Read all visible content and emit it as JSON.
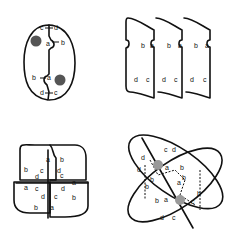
{
  "figure": {
    "panels": [
      {
        "id": "panel-1",
        "description": "Two cells forming a closed oval pair with nuclei",
        "labels": [
          "c",
          "d",
          "a",
          "b",
          "b",
          "a",
          "d",
          "c"
        ]
      },
      {
        "id": "panel-2",
        "description": "Three stacked tiles in a row",
        "labels": [
          "b",
          "a",
          "b",
          "a",
          "b",
          "a",
          "d",
          "c",
          "d",
          "c",
          "d",
          "c"
        ]
      },
      {
        "id": "panel-3",
        "description": "Four tiles forming a square with central cross",
        "labels": [
          "a",
          "b",
          "b",
          "a",
          "c",
          "d",
          "d",
          "c",
          "c",
          "d",
          "a",
          "b",
          "c",
          "d",
          "b",
          "a"
        ]
      },
      {
        "id": "panel-4",
        "description": "Two overlapping ovals with dashed boundaries and diagonal axis",
        "labels": [
          "c",
          "d",
          "a",
          "b",
          "d",
          "d",
          "b",
          "b",
          "a",
          "b",
          "b",
          "a",
          "c",
          "d",
          "c"
        ]
      }
    ],
    "colors": {
      "line": "#111111",
      "background": "#ffffff"
    }
  }
}
